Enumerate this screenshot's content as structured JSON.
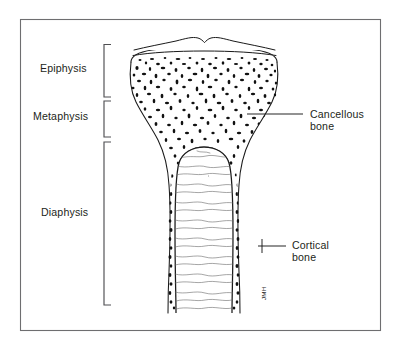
{
  "figure": {
    "caption_visible": false,
    "background_color": "#ffffff",
    "frame_color": "#6e6e70",
    "ink_color": "#1a1a1a",
    "label_color": "#231f20"
  },
  "region_labels": [
    {
      "id": "epiphysis",
      "label": "Epiphysis",
      "text_x": 40,
      "text_y": 72,
      "bracket_x": 104,
      "bracket_top": 44,
      "bracket_bottom": 97,
      "bracket_tip": 7
    },
    {
      "id": "metaphysis",
      "label": "Metaphysis",
      "text_x": 33,
      "text_y": 120,
      "bracket_x": 104,
      "bracket_top": 101,
      "bracket_bottom": 137,
      "bracket_tip": 7
    },
    {
      "id": "diaphysis",
      "label": "Diaphysis",
      "text_x": 41,
      "text_y": 216,
      "bracket_x": 104,
      "bracket_top": 142,
      "bracket_bottom": 305,
      "bracket_tip": 7
    }
  ],
  "callouts": [
    {
      "id": "cancellous-bone",
      "line1": "Cancellous",
      "line2": "bone",
      "text_x": 310,
      "text_y1": 118,
      "text_y2": 130,
      "leader_x1": 247,
      "leader_y1": 114,
      "leader_x2": 303,
      "leader_y2": 114
    },
    {
      "id": "cortical-bone",
      "line1": "Cortical",
      "line2": "bone",
      "text_x": 292,
      "text_y1": 249,
      "text_y2": 261,
      "leader_x1": 258,
      "leader_y1": 246,
      "leader_x2": 286,
      "leader_y2": 246,
      "tick_x": 262,
      "tick_y1": 239,
      "tick_y2": 253
    }
  ],
  "signature": {
    "text": "JMH",
    "x": 266,
    "y": 300,
    "rotation": -90
  },
  "frame": {
    "x": 20,
    "y": 19,
    "width": 361,
    "height": 312
  },
  "anatomy_parts": [
    {
      "name": "articular-cartilage-cap",
      "description": "thin curved cap with central notch at top of epiphysis"
    },
    {
      "name": "epiphysis-cancellous-region",
      "description": "dense speckled trabecular bone in the epiphysis"
    },
    {
      "name": "metaphysis-flare",
      "description": "concave flaring transition between epiphysis and shaft"
    },
    {
      "name": "medullary-cavity",
      "description": "open marrow cavity in the diaphysis with horizontal trabecular striations"
    },
    {
      "name": "cortical-bone-wall",
      "description": "dense outer compact bone wall along the shaft"
    }
  ]
}
